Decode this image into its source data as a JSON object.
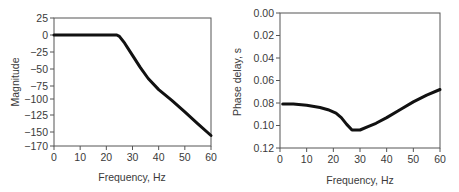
{
  "chart_data": [
    {
      "type": "line",
      "title": "",
      "xlabel": "Frequency, Hz",
      "ylabel": "Magnitude",
      "xlim": [
        0,
        60
      ],
      "ylim": [
        -170,
        25
      ],
      "xticks": [
        0,
        10,
        20,
        30,
        40,
        50,
        60
      ],
      "yticks": [
        25,
        0,
        -25,
        -50,
        -75,
        -100,
        -125,
        -150,
        -170
      ],
      "ytick_labels": [
        "25",
        "0",
        "−25",
        "−50",
        "−75",
        "−100",
        "−125",
        "−150",
        "−170"
      ],
      "grid": false,
      "legend": null,
      "series": [
        {
          "name": "Magnitude",
          "x": [
            0,
            5,
            10,
            15,
            20,
            23,
            24,
            25,
            27,
            30,
            33,
            36,
            40,
            45,
            50,
            55,
            60
          ],
          "y": [
            0,
            0,
            0,
            0,
            0,
            0,
            0,
            -2,
            -12,
            -30,
            -48,
            -64,
            -82,
            -102,
            -120,
            -138,
            -155
          ]
        }
      ]
    },
    {
      "type": "line",
      "title": "",
      "xlabel": "Frequency, Hz",
      "ylabel": "Phase delay, s",
      "xlim": [
        0,
        60
      ],
      "ylim": [
        0.0,
        0.12
      ],
      "xticks": [
        0,
        10,
        20,
        30,
        40,
        50,
        60
      ],
      "yticks": [
        0.0,
        0.02,
        0.04,
        0.06,
        0.08,
        0.1,
        0.12
      ],
      "ytick_labels": [
        "0.00",
        "0.02",
        "0.04",
        "0.06",
        "0.08",
        "0.10",
        "0.12"
      ],
      "grid": false,
      "legend": null,
      "series": [
        {
          "name": "Phase delay",
          "x": [
            1,
            5,
            10,
            15,
            18,
            21,
            23,
            25,
            27,
            28,
            30,
            33,
            36,
            40,
            45,
            50,
            55,
            60
          ],
          "y": [
            0.081,
            0.081,
            0.082,
            0.084,
            0.086,
            0.089,
            0.093,
            0.099,
            0.104,
            0.104,
            0.104,
            0.101,
            0.098,
            0.093,
            0.086,
            0.079,
            0.073,
            0.068
          ]
        }
      ]
    }
  ],
  "charts": {
    "left": {
      "xlabel": "Frequency, Hz",
      "ylabel": "Magnitude"
    },
    "right": {
      "xlabel": "Frequency, Hz",
      "ylabel": "Phase delay, s"
    }
  }
}
